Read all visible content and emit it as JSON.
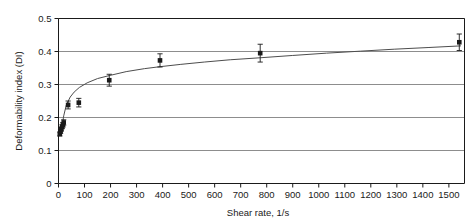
{
  "chart_data": {
    "type": "scatter",
    "title": "",
    "xlabel": "Shear rate, 1/s",
    "ylabel": "Deformability index (DI)",
    "xlim": [
      0,
      1560
    ],
    "ylim": [
      0,
      0.5
    ],
    "xticks": [
      0,
      100,
      200,
      300,
      400,
      500,
      600,
      700,
      800,
      900,
      1000,
      1100,
      1200,
      1300,
      1400,
      1500
    ],
    "yticks": [
      0,
      0.1,
      0.2,
      0.3,
      0.4,
      0.5
    ],
    "xtick_labels": [
      "0",
      "100",
      "200",
      "300",
      "400",
      "500",
      "600",
      "700",
      "800",
      "900",
      "1000",
      "1100",
      "1200",
      "1300",
      "1400",
      "1500"
    ],
    "ytick_labels": [
      "0",
      "0.1",
      "0.2",
      "0.3",
      "0.4",
      "0.5"
    ],
    "grid": "horizontal",
    "legend": "none",
    "marker": "filled-square-with-error-bars",
    "series": [
      {
        "name": "Deformability index",
        "x": [
          5,
          8,
          11,
          14,
          17,
          20,
          37,
          78,
          195,
          390,
          775,
          1540
        ],
        "y": [
          0.15,
          0.158,
          0.165,
          0.172,
          0.178,
          0.185,
          0.238,
          0.245,
          0.313,
          0.373,
          0.395,
          0.428
        ],
        "yerr": [
          0.006,
          0.006,
          0.006,
          0.006,
          0.007,
          0.008,
          0.012,
          0.013,
          0.018,
          0.02,
          0.027,
          0.025
        ]
      }
    ],
    "fit_curve": {
      "name": "fitted power-law trend",
      "x": [
        14,
        20,
        30,
        45,
        60,
        80,
        110,
        150,
        195,
        260,
        330,
        390,
        470,
        560,
        660,
        775,
        900,
        1030,
        1160,
        1290,
        1420,
        1545
      ],
      "y": [
        0.175,
        0.205,
        0.238,
        0.262,
        0.277,
        0.291,
        0.305,
        0.318,
        0.327,
        0.339,
        0.348,
        0.354,
        0.361,
        0.368,
        0.375,
        0.381,
        0.388,
        0.395,
        0.401,
        0.407,
        0.412,
        0.417
      ]
    },
    "colors": {
      "marker": "#1a1a1a",
      "line": "#4d4d4d",
      "grid": "#808080",
      "axis": "#1a1a1a",
      "background": "#ffffff"
    }
  }
}
